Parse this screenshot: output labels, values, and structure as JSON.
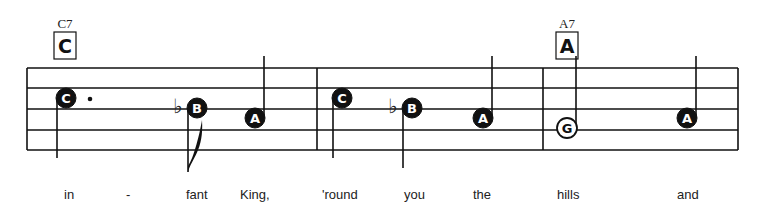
{
  "score": {
    "colors": {
      "ink": "#111111",
      "paper": "#ffffff"
    },
    "staff": {
      "left": 27,
      "right": 738,
      "lines_y": [
        68,
        88,
        109,
        130,
        150
      ]
    },
    "barlines_x": [
      27,
      317,
      543,
      738
    ],
    "chords": [
      {
        "name": "C7",
        "box_letter": "C",
        "x": 65
      },
      {
        "name": "A7",
        "box_letter": "A",
        "x": 567
      }
    ],
    "notes": [
      {
        "letter": "C",
        "x": 66,
        "y": 98,
        "filled": true,
        "dotted": true,
        "stem": "down-left",
        "accidental": ""
      },
      {
        "letter": "B",
        "x": 197,
        "y": 108,
        "filled": true,
        "dotted": false,
        "stem": "down-left-flag",
        "accidental": "flat"
      },
      {
        "letter": "A",
        "x": 255,
        "y": 118,
        "filled": true,
        "dotted": false,
        "stem": "up-right",
        "accidental": ""
      },
      {
        "letter": "C",
        "x": 342,
        "y": 98,
        "filled": true,
        "dotted": false,
        "stem": "down-left",
        "accidental": ""
      },
      {
        "letter": "B",
        "x": 412,
        "y": 108,
        "filled": true,
        "dotted": false,
        "stem": "down-left",
        "accidental": "flat"
      },
      {
        "letter": "A",
        "x": 483,
        "y": 118,
        "filled": true,
        "dotted": false,
        "stem": "up-right",
        "accidental": ""
      },
      {
        "letter": "G",
        "x": 567,
        "y": 128,
        "filled": false,
        "dotted": false,
        "stem": "up-right",
        "accidental": ""
      },
      {
        "letter": "A",
        "x": 687,
        "y": 118,
        "filled": true,
        "dotted": false,
        "stem": "up-right",
        "accidental": ""
      }
    ],
    "lyrics": [
      {
        "text": "in",
        "x": 64
      },
      {
        "text": "-",
        "x": 126
      },
      {
        "text": "fant",
        "x": 186
      },
      {
        "text": "King,",
        "x": 240
      },
      {
        "text": "'round",
        "x": 322
      },
      {
        "text": "you",
        "x": 404
      },
      {
        "text": "the",
        "x": 473
      },
      {
        "text": "hills",
        "x": 557
      },
      {
        "text": "and",
        "x": 677
      }
    ]
  }
}
